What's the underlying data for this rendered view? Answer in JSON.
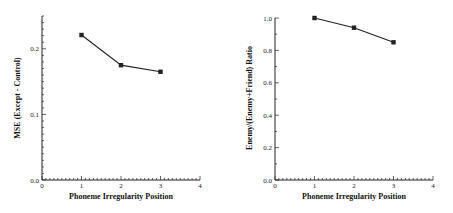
{
  "chart_data": [
    {
      "type": "line",
      "title": "",
      "xlabel": "Phoneme Irregularity Position",
      "ylabel": "MSE (Except - Control)",
      "xlim": [
        0,
        4
      ],
      "ylim": [
        0.0,
        0.25
      ],
      "xticks": [
        "0",
        "1",
        "2",
        "3",
        "4"
      ],
      "yticks": [
        "0.0",
        "0.1",
        "0.2"
      ],
      "x": [
        1,
        2,
        3
      ],
      "series": [
        {
          "name": "MSE",
          "values": [
            0.221,
            0.175,
            0.165
          ]
        }
      ],
      "marker": "square",
      "grid": false,
      "legend": null
    },
    {
      "type": "line",
      "title": "",
      "xlabel": "Phoneme Irregularity Position",
      "ylabel": "Enemy/(Enemy+Friend) Ratio",
      "xlim": [
        0,
        4
      ],
      "ylim": [
        0.0,
        1.0
      ],
      "xticks": [
        "0",
        "1",
        "2",
        "3",
        "4"
      ],
      "yticks": [
        "0.0",
        "0.2",
        "0.4",
        "0.6",
        "0.8",
        "1.0"
      ],
      "x": [
        1,
        2,
        3
      ],
      "series": [
        {
          "name": "Ratio",
          "values": [
            1.0,
            0.94,
            0.85
          ]
        }
      ],
      "marker": "square",
      "grid": false,
      "legend": null
    }
  ],
  "left": {
    "xlabel": "Phoneme Irregularity Position",
    "ylabel": "MSE (Except - Control)",
    "xticks": [
      "0",
      "1",
      "2",
      "3",
      "4"
    ],
    "yticks": [
      "0.0",
      "0.1",
      "0.2"
    ]
  },
  "right": {
    "xlabel": "Phoneme Irregularity Position",
    "ylabel": "Enemy/(Enemy+Friend) Ratio",
    "xticks": [
      "0",
      "1",
      "2",
      "3",
      "4"
    ],
    "yticks": [
      "0.0",
      "0.2",
      "0.4",
      "0.6",
      "0.8",
      "1.0"
    ]
  },
  "colors": {
    "line": "#222222",
    "axis": "#222222"
  }
}
